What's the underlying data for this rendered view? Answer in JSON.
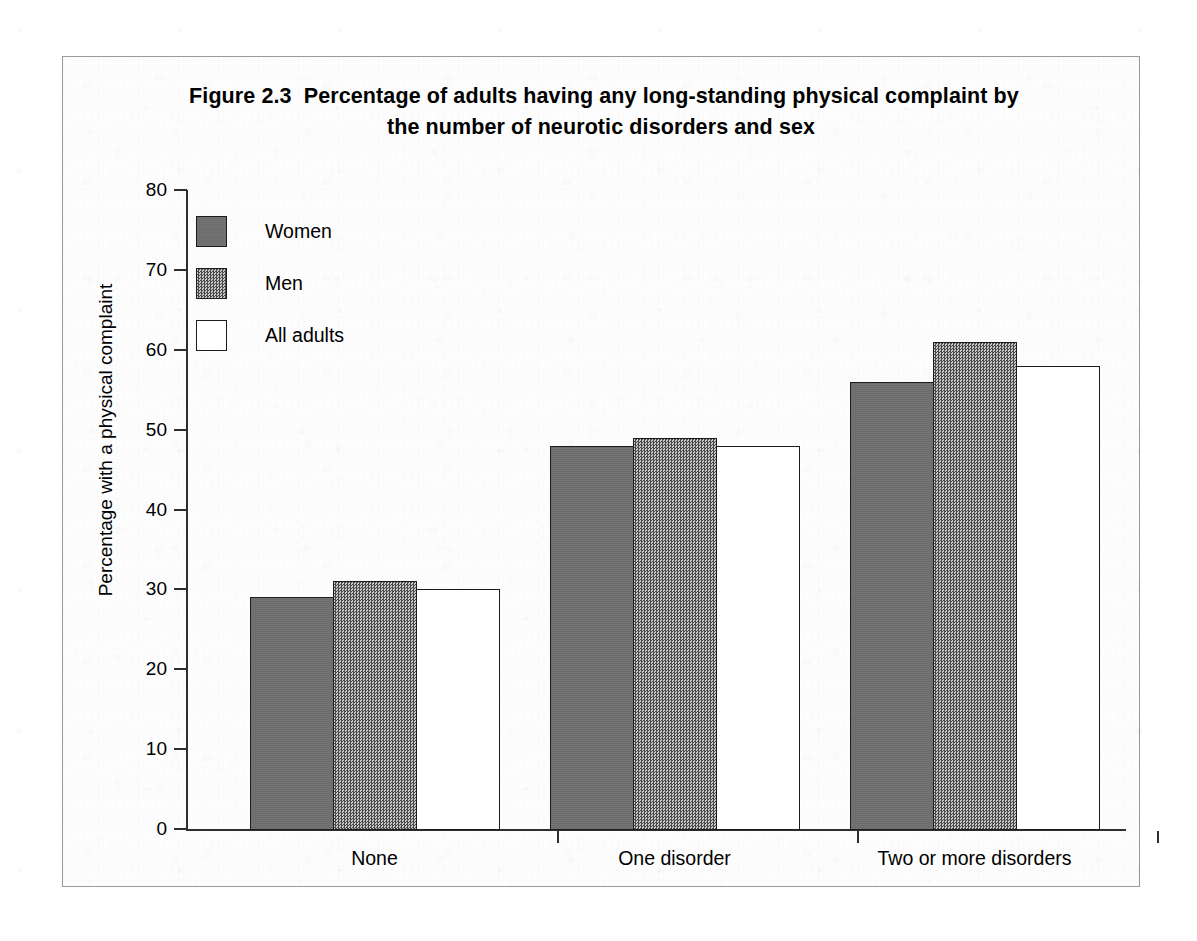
{
  "figure": {
    "frame_border_color": "#9a9a9a",
    "title_line1": "Figure 2.3  Percentage of adults having any long-standing physical complaint by",
    "title_line2": "the number of neurotic disorders and sex"
  },
  "legend": {
    "items": [
      {
        "label": "Women",
        "swatch": "dark-grey-solid-swatch",
        "color": "#6f6f6f"
      },
      {
        "label": "Men",
        "swatch": "grey-dither-swatch",
        "color": "#8b8b8b"
      },
      {
        "label": "All adults",
        "swatch": "white-swatch",
        "color": "#ffffff"
      }
    ]
  },
  "axes": {
    "y_label": "Percentage with a physical complaint",
    "y_ticks": [
      "0",
      "10",
      "20",
      "30",
      "40",
      "50",
      "60",
      "70",
      "80"
    ],
    "x_labels": [
      "None",
      "One disorder",
      "Two or more disorders"
    ]
  },
  "chart_data": {
    "type": "bar",
    "title": "Figure 2.3  Percentage of adults having any long-standing physical complaint by the number of neurotic disorders and sex",
    "xlabel": "",
    "ylabel": "Percentage with a physical complaint",
    "ylim": [
      0,
      80
    ],
    "ytick_step": 10,
    "grid": false,
    "legend_position": "upper-left-inside",
    "categories": [
      "None",
      "One disorder",
      "Two or more disorders"
    ],
    "series": [
      {
        "name": "Women",
        "color": "#6f6f6f",
        "values": [
          29,
          48,
          56
        ]
      },
      {
        "name": "Men",
        "color": "#8b8b8b",
        "values": [
          31,
          49,
          61
        ]
      },
      {
        "name": "All adults",
        "color": "#ffffff",
        "values": [
          30,
          48,
          58
        ]
      }
    ]
  }
}
